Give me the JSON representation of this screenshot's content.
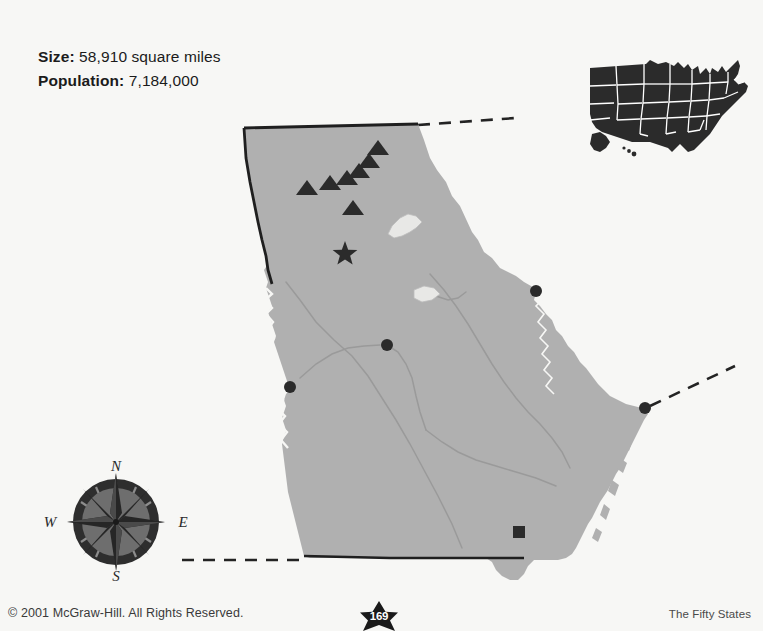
{
  "page": {
    "background_color": "#f7f7f5",
    "state_name": "Georgia"
  },
  "stats": {
    "size_label": "Size:",
    "size_value": "58,910 square miles",
    "population_label": "Population:",
    "population_value": "7,184,000"
  },
  "footer": {
    "copyright": "© 2001 McGraw-Hill. All Rights Reserved.",
    "series": "The Fifty States",
    "page_number": "169"
  },
  "compass": {
    "north": "N",
    "west": "W",
    "east": "E",
    "ring_color": "#2a2a2a",
    "disc_color": "#6e6e6e"
  },
  "inset": {
    "name": "united-states-locator",
    "fill_color": "#2b2b2b",
    "border_color": "#ffffff"
  },
  "map": {
    "state_fill": "#b0b0b0",
    "outline_color": "#1f1f1f",
    "river_color": "#9a9a9a",
    "symbol_color": "#2b2b2b",
    "capital_symbol": "star",
    "city_symbol": "circle",
    "mountain_symbol": "triangle",
    "landmark_symbol": "square",
    "mountains": [
      {
        "x": 307,
        "y": 195
      },
      {
        "x": 330,
        "y": 190
      },
      {
        "x": 347,
        "y": 185
      },
      {
        "x": 353,
        "y": 215
      },
      {
        "x": 359,
        "y": 178
      },
      {
        "x": 369,
        "y": 168
      },
      {
        "x": 378,
        "y": 155
      }
    ],
    "capital": {
      "x": 345,
      "y": 254
    },
    "cities": [
      {
        "x": 387,
        "y": 345
      },
      {
        "x": 290,
        "y": 387
      },
      {
        "x": 536,
        "y": 291
      },
      {
        "x": 645,
        "y": 408
      }
    ],
    "landmarks": [
      {
        "x": 519,
        "y": 532
      }
    ]
  }
}
